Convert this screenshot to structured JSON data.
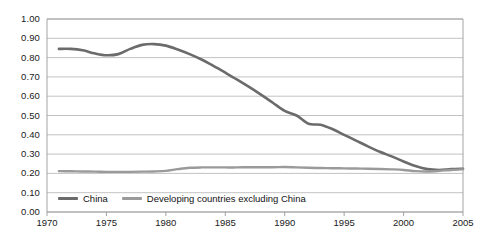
{
  "chart_data": {
    "type": "line",
    "title": "",
    "xlabel": "",
    "ylabel": "",
    "xlim": [
      1970,
      2005
    ],
    "ylim": [
      0.0,
      1.0
    ],
    "grid": true,
    "legend_position": "bottom-left-inside",
    "y_ticks": [
      "0.00",
      "0.10",
      "0.20",
      "0.30",
      "0.40",
      "0.50",
      "0.60",
      "0.70",
      "0.80",
      "0.90",
      "1.00"
    ],
    "x_ticks": [
      "1970",
      "1975",
      "1980",
      "1985",
      "1990",
      "1995",
      "2000",
      "2005"
    ],
    "series": [
      {
        "name": "China",
        "color": "#6b6b6b",
        "x": [
          1971,
          1972,
          1973,
          1974,
          1975,
          1976,
          1977,
          1978,
          1979,
          1980,
          1981,
          1982,
          1983,
          1984,
          1985,
          1986,
          1987,
          1988,
          1989,
          1990,
          1991,
          1992,
          1993,
          1994,
          1995,
          1996,
          1997,
          1998,
          1999,
          2000,
          2001,
          2002,
          2003,
          2004,
          2005
        ],
        "values": [
          0.845,
          0.845,
          0.838,
          0.822,
          0.812,
          0.818,
          0.845,
          0.866,
          0.87,
          0.862,
          0.842,
          0.818,
          0.79,
          0.757,
          0.722,
          0.686,
          0.648,
          0.608,
          0.566,
          0.524,
          0.5,
          0.457,
          0.452,
          0.43,
          0.4,
          0.37,
          0.34,
          0.312,
          0.288,
          0.262,
          0.238,
          0.222,
          0.218,
          0.222,
          0.224
        ]
      },
      {
        "name": "Developing countries excluding China",
        "color": "#9a9a9a",
        "x": [
          1971,
          1972,
          1973,
          1974,
          1975,
          1976,
          1977,
          1978,
          1979,
          1980,
          1981,
          1982,
          1983,
          1984,
          1985,
          1986,
          1987,
          1988,
          1989,
          1990,
          1991,
          1992,
          1993,
          1994,
          1995,
          1996,
          1997,
          1998,
          1999,
          2000,
          2001,
          2002,
          2003,
          2004,
          2005
        ],
        "values": [
          0.212,
          0.211,
          0.21,
          0.209,
          0.208,
          0.208,
          0.208,
          0.209,
          0.21,
          0.213,
          0.222,
          0.229,
          0.231,
          0.231,
          0.231,
          0.231,
          0.232,
          0.232,
          0.232,
          0.233,
          0.231,
          0.229,
          0.228,
          0.227,
          0.226,
          0.225,
          0.224,
          0.223,
          0.221,
          0.218,
          0.212,
          0.21,
          0.213,
          0.218,
          0.221
        ]
      }
    ]
  },
  "axes": {
    "plot_left_px": 47,
    "plot_right_px": 463,
    "plot_top_px": 19,
    "plot_bottom_px": 212,
    "grid_color": "#b3b3b3",
    "frame_color": "#9a9a9a",
    "label_color": "#1a1a1a"
  },
  "legend": {
    "entries": [
      {
        "label": "China",
        "color": "#6b6b6b"
      },
      {
        "label": "Developing countries excluding China",
        "color": "#9a9a9a"
      }
    ]
  }
}
